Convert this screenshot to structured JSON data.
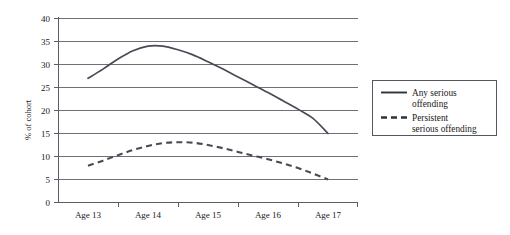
{
  "chart_data": {
    "type": "line",
    "title": "",
    "subtitle": "",
    "xlabel": "",
    "ylabel": "% of cohort",
    "categories": [
      "Age 13",
      "Age 14",
      "Age 15",
      "Age 16",
      "Age 17"
    ],
    "xtick_labels": [
      "Age 13",
      "Age 14",
      "Age 15",
      "Age 16",
      "Age 17"
    ],
    "ytick_labels": [
      "0",
      "5",
      "10",
      "15",
      "20",
      "25",
      "30",
      "35",
      "40"
    ],
    "ytick_values": [
      0,
      5,
      10,
      15,
      20,
      25,
      30,
      35,
      40
    ],
    "ylim": [
      0,
      40
    ],
    "grid": "horizontal",
    "legend_position": "right",
    "series": [
      {
        "name": "Any serious offending",
        "legend_label_line1": "Any serious",
        "legend_label_line2": "offending",
        "style": "solid",
        "color": "#494b54",
        "values": [
          27,
          34,
          30,
          24,
          15
        ],
        "curve_points": [
          [
            13.0,
            27.0
          ],
          [
            13.25,
            29.0
          ],
          [
            13.5,
            31.2
          ],
          [
            13.75,
            33.0
          ],
          [
            14.0,
            34.0
          ],
          [
            14.25,
            34.0
          ],
          [
            14.5,
            33.2
          ],
          [
            14.75,
            32.1
          ],
          [
            15.0,
            30.6
          ],
          [
            15.25,
            29.0
          ],
          [
            15.5,
            27.3
          ],
          [
            15.75,
            25.6
          ],
          [
            16.0,
            23.9
          ],
          [
            16.25,
            22.1
          ],
          [
            16.5,
            20.3
          ],
          [
            16.75,
            18.3
          ],
          [
            17.0,
            15.0
          ]
        ]
      },
      {
        "name": "Persistent serious offending",
        "legend_label_line1": "Persistent",
        "legend_label_line2": "serious offending",
        "style": "dashed",
        "color": "#494b54",
        "values": [
          8,
          12,
          13,
          9.5,
          5
        ],
        "curve_points": [
          [
            13.0,
            8.0
          ],
          [
            13.25,
            9.1
          ],
          [
            13.5,
            10.3
          ],
          [
            13.75,
            11.4
          ],
          [
            14.0,
            12.3
          ],
          [
            14.25,
            12.9
          ],
          [
            14.5,
            13.1
          ],
          [
            14.75,
            13.0
          ],
          [
            15.0,
            12.5
          ],
          [
            15.25,
            11.8
          ],
          [
            15.5,
            11.0
          ],
          [
            15.75,
            10.2
          ],
          [
            16.0,
            9.4
          ],
          [
            16.25,
            8.5
          ],
          [
            16.5,
            7.5
          ],
          [
            16.75,
            6.3
          ],
          [
            17.0,
            5.0
          ]
        ]
      }
    ]
  },
  "legend": {
    "entries": [
      {
        "line1": "Any serious",
        "line2": "offending",
        "style": "solid"
      },
      {
        "line1": "Persistent",
        "line2": "serious offending",
        "style": "dashed"
      }
    ]
  },
  "axis": {
    "y_title": "% of cohort"
  }
}
